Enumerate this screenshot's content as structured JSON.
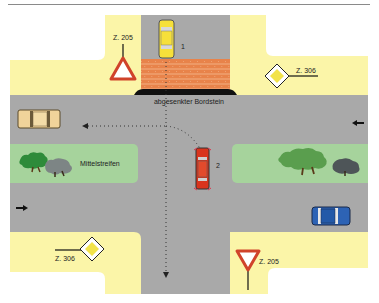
{
  "diagram": {
    "colors": {
      "road": "#a9a9a9",
      "sidewalk": "#fbf5a8",
      "median": "#a6d39c",
      "brick": "#e8834a",
      "curb": "#111111",
      "sign_red": "#d0432a",
      "sign_yellow": "#f2e34a"
    },
    "labels": {
      "lowered_curb": "abgesenkter Bordstein",
      "median": "Mittelstreifen",
      "car1": "1",
      "car2": "2"
    },
    "signs": [
      {
        "id": "yield-top-left",
        "label": "Z. 205",
        "type": "yield"
      },
      {
        "id": "priority-top-right",
        "label": "Z. 306",
        "type": "priority-road"
      },
      {
        "id": "priority-bottom-left",
        "label": "Z. 306",
        "type": "priority-road"
      },
      {
        "id": "yield-bottom-right",
        "label": "Z. 205",
        "type": "yield"
      }
    ],
    "vehicles": [
      {
        "id": "car-1",
        "color": "yellow",
        "heading": "south"
      },
      {
        "id": "car-2",
        "color": "red",
        "heading": "south"
      },
      {
        "id": "car-beige",
        "color": "beige",
        "heading": "west"
      },
      {
        "id": "car-blue",
        "color": "blue",
        "heading": "east"
      }
    ],
    "direction_arrows": [
      {
        "id": "arrow-right-lane",
        "direction": "west"
      },
      {
        "id": "arrow-left-lane",
        "direction": "east"
      }
    ]
  }
}
